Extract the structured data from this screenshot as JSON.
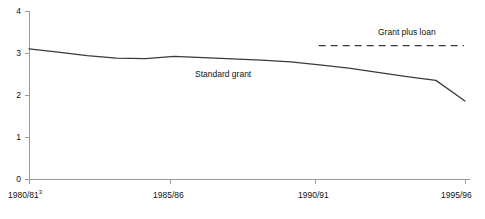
{
  "chart_data": {
    "type": "line",
    "title": "",
    "subtitle": "",
    "xlabel": "",
    "ylabel": "",
    "xlim": [
      1980,
      1995
    ],
    "ylim": [
      0,
      4
    ],
    "yticks": [
      0,
      1,
      2,
      3,
      4
    ],
    "ytick_labels": [
      "0",
      "1",
      "2",
      "3",
      "4"
    ],
    "xticks": [
      1980,
      1985,
      1990,
      1995
    ],
    "xtick_labels": [
      "1980/81",
      "1985/86",
      "1990/91",
      "1995/96"
    ],
    "xtick_footnote": "3",
    "xtick_footnote_on": "1980/81",
    "grid": false,
    "legend_position": "inline-annotation",
    "axis_color": "#999999",
    "line_color": "#333333",
    "text_color": "#111111",
    "series": [
      {
        "name": "Standard grant",
        "style": "solid",
        "color": "#333333",
        "x": [
          1980,
          1981,
          1982,
          1983,
          1984,
          1985,
          1986,
          1987,
          1988,
          1989,
          1990,
          1991,
          1992,
          1993,
          1994,
          1995
        ],
        "values": [
          3.11,
          3.03,
          2.95,
          2.89,
          2.88,
          2.93,
          2.9,
          2.87,
          2.84,
          2.8,
          2.73,
          2.65,
          2.55,
          2.45,
          2.36,
          1.87
        ],
        "annotation": "Standard grant",
        "annotation_x": 1985.7,
        "annotation_y": 2.37
      },
      {
        "name": "Grant plus loan",
        "style": "dashed",
        "color": "#333333",
        "x": [
          1990,
          1991,
          1992,
          1993,
          1994,
          1995
        ],
        "values": [
          3.19,
          3.19,
          3.19,
          3.19,
          3.19,
          3.19
        ],
        "annotation": "Grant plus loan",
        "annotation_x": 1992.2,
        "annotation_y": 3.62
      }
    ]
  },
  "axes": {
    "y_labels": [
      "4",
      "3",
      "2",
      "1",
      "0"
    ],
    "x_labels": [
      "1980/81",
      "1985/86",
      "1990/91",
      "1995/96"
    ],
    "footnote_superscript": "3"
  },
  "annotations": {
    "standard_grant": "Standard grant",
    "grant_plus_loan": "Grant plus loan"
  }
}
